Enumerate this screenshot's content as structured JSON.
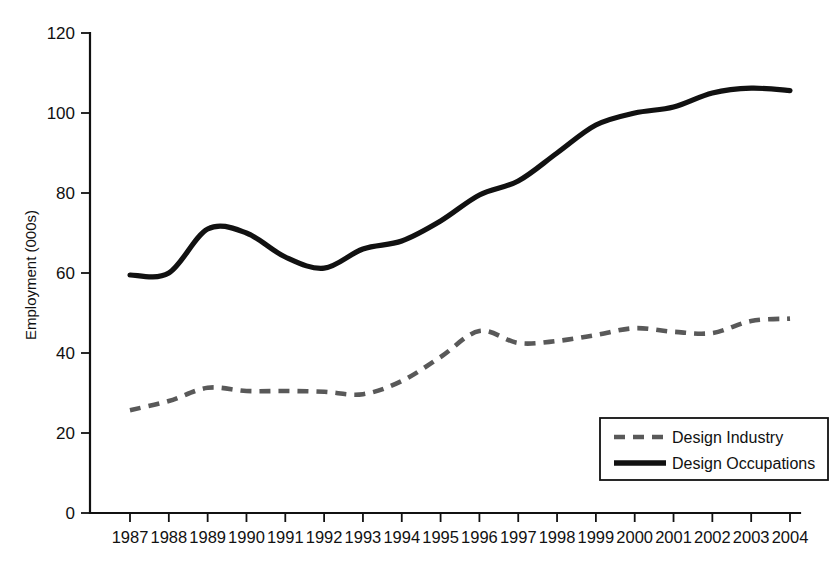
{
  "chart_data": {
    "type": "line",
    "title": "",
    "xlabel": "",
    "ylabel": "Employment (000s)",
    "x": [
      1987,
      1988,
      1989,
      1990,
      1991,
      1992,
      1993,
      1994,
      1995,
      1996,
      1997,
      1998,
      1999,
      2000,
      2001,
      2002,
      2003,
      2004
    ],
    "categories": [
      "1987",
      "1988",
      "1989",
      "1990",
      "1991",
      "1992",
      "1993",
      "1994",
      "1995",
      "1996",
      "1997",
      "1998",
      "1999",
      "2000",
      "2001",
      "2002",
      "2003",
      "2004"
    ],
    "xlim": [
      1987,
      2004
    ],
    "ylim": [
      0,
      120
    ],
    "yticks": [
      0,
      20,
      40,
      60,
      80,
      100,
      120
    ],
    "ytick_labels": [
      "0",
      "20",
      "40",
      "60",
      "80",
      "100",
      "120"
    ],
    "grid": false,
    "legend_position": "bottom-right",
    "series": [
      {
        "name": "Design Industry",
        "style": "dashed",
        "color": "#595959",
        "values": [
          25.7,
          28.0,
          31.3,
          30.5,
          30.5,
          30.3,
          29.7,
          33.0,
          39.0,
          45.5,
          42.5,
          43.0,
          44.5,
          46.2,
          45.3,
          45.0,
          48.0,
          48.6
        ]
      },
      {
        "name": "Design Occupations",
        "style": "solid",
        "color": "#111111",
        "values": [
          59.5,
          60.0,
          71.0,
          70.0,
          64.0,
          61.2,
          66.0,
          68.0,
          73.0,
          79.5,
          83.0,
          90.0,
          97.0,
          100.0,
          101.5,
          105.0,
          106.2,
          105.6
        ]
      }
    ]
  },
  "legend": {
    "items": [
      {
        "label": "Design Industry",
        "style": "dashed",
        "color": "#595959"
      },
      {
        "label": "Design Occupations",
        "style": "solid",
        "color": "#111111"
      }
    ]
  },
  "axes": {
    "y_title": "Employment (000s)"
  }
}
